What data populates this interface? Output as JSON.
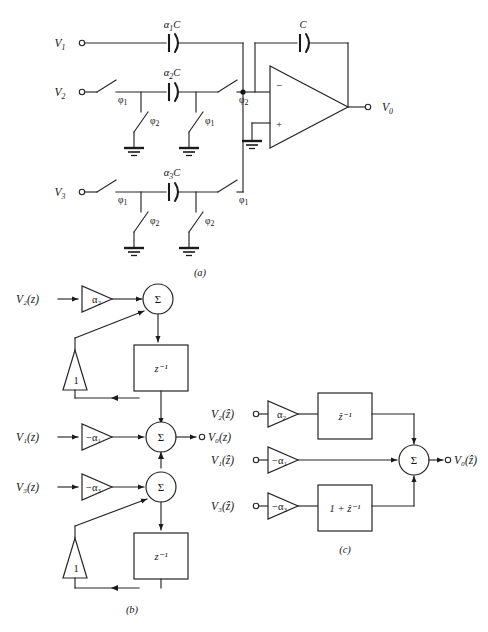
{
  "figure": {
    "panels": [
      {
        "id": "a",
        "label": "(a)",
        "caption": "Switched-capacitor circuit"
      },
      {
        "id": "b",
        "label": "(b)",
        "caption": "z-domain block diagram"
      },
      {
        "id": "c",
        "label": "(c)",
        "caption": "z-hat domain block diagram"
      }
    ]
  },
  "colors": {
    "ink": "#1a1a1a",
    "wire": "#262626",
    "background": "#ffffff"
  },
  "panel_a": {
    "panel_label": "(a)",
    "inputs": [
      {
        "name": "V1",
        "label": "V",
        "subscript": "1"
      },
      {
        "name": "V2",
        "label": "V",
        "subscript": "2"
      },
      {
        "name": "V3",
        "label": "V",
        "subscript": "3"
      }
    ],
    "output": {
      "name": "V0",
      "label": "V",
      "subscript": "0"
    },
    "capacitors": [
      {
        "name": "alpha1C",
        "alpha": "α",
        "alpha_sub": "1",
        "cap": "C",
        "text": "α₁C"
      },
      {
        "name": "alpha2C",
        "alpha": "α",
        "alpha_sub": "2",
        "cap": "C",
        "text": "α₂C"
      },
      {
        "name": "alpha3C",
        "alpha": "α",
        "alpha_sub": "3",
        "cap": "C",
        "text": "α₃C"
      },
      {
        "name": "feedbackC",
        "alpha": "",
        "alpha_sub": "",
        "cap": "C",
        "text": "C"
      }
    ],
    "switches": [
      {
        "name": "sw-v2-in",
        "phase": "ϕ",
        "phase_sub": "1"
      },
      {
        "name": "sw-v2-out",
        "phase": "ϕ",
        "phase_sub": "2"
      },
      {
        "name": "sw-v2-shunt-left",
        "phase": "ϕ",
        "phase_sub": "2"
      },
      {
        "name": "sw-v2-shunt-right",
        "phase": "ϕ",
        "phase_sub": "1"
      },
      {
        "name": "sw-v3-in",
        "phase": "ϕ",
        "phase_sub": "1"
      },
      {
        "name": "sw-v3-out",
        "phase": "ϕ",
        "phase_sub": "1"
      },
      {
        "name": "sw-v3-shunt-left",
        "phase": "ϕ",
        "phase_sub": "2"
      },
      {
        "name": "sw-v3-shunt-right",
        "phase": "ϕ",
        "phase_sub": "2"
      }
    ],
    "opamp": {
      "name": "operational-amplifier",
      "inverting_sign": "−",
      "noninverting_sign": "+"
    },
    "ground_count": 5
  },
  "panel_b": {
    "panel_label": "(b)",
    "inputs": [
      {
        "name": "V2z",
        "text": "V₂(z)"
      },
      {
        "name": "V1z",
        "text": "V₁(z)"
      },
      {
        "name": "V3z",
        "text": "V₃(z)"
      }
    ],
    "output": {
      "name": "V0z",
      "text": "V₀(z)"
    },
    "gains": [
      {
        "name": "gain-alpha2",
        "text": "α₂"
      },
      {
        "name": "gain-neg-alpha1",
        "text": "−α₁"
      },
      {
        "name": "gain-neg-alpha3",
        "text": "−α₃"
      },
      {
        "name": "gain-unity-top",
        "text": "1"
      },
      {
        "name": "gain-unity-bottom",
        "text": "1"
      }
    ],
    "delay_blocks": [
      {
        "name": "delay-top",
        "text": "z⁻¹"
      },
      {
        "name": "delay-bottom",
        "text": "z⁻¹"
      }
    ],
    "summers": [
      {
        "name": "summer-top",
        "text": "Σ"
      },
      {
        "name": "summer-middle",
        "text": "Σ"
      },
      {
        "name": "summer-bottom",
        "text": "Σ"
      }
    ]
  },
  "panel_c": {
    "panel_label": "(c)",
    "inputs": [
      {
        "name": "V2zhat",
        "text": "V₂(ẑ)"
      },
      {
        "name": "V1zhat",
        "text": "V₁(ẑ)"
      },
      {
        "name": "V3zhat",
        "text": "V₃(ẑ)"
      }
    ],
    "output": {
      "name": "V0zhat",
      "text": "V₀(ẑ)"
    },
    "gains": [
      {
        "name": "gain-alpha2",
        "text": "α₂"
      },
      {
        "name": "gain-neg-alpha1",
        "text": "−α₁"
      },
      {
        "name": "gain-neg-alpha3",
        "text": "−α₃"
      }
    ],
    "blocks": [
      {
        "name": "block-delay-hat",
        "text": "ẑ⁻¹"
      },
      {
        "name": "block-one-plus-delay-hat",
        "text": "1 + ẑ⁻¹"
      }
    ],
    "summer": {
      "name": "summer",
      "text": "Σ"
    }
  }
}
